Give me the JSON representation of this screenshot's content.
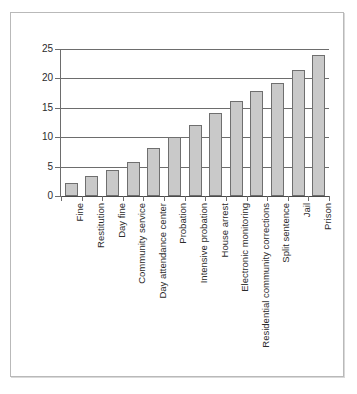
{
  "chart_data": {
    "type": "bar",
    "title": "",
    "subtitle": "",
    "xlabel": "",
    "ylabel": "",
    "ylim": [
      0,
      25
    ],
    "yticks": [
      0,
      5,
      10,
      15,
      20,
      25
    ],
    "ytick_labels": [
      "0",
      "5",
      "10",
      "15",
      "20",
      "25"
    ],
    "grid": true,
    "grid_axis": "y",
    "legend": null,
    "orientation": "vertical",
    "categories": [
      "Fine",
      "Restitution",
      "Day fine",
      "Community service",
      "Day attendance center",
      "Probation",
      "Intensive probation",
      "House arrest",
      "Electronic monitoring",
      "Residential community corrections",
      "Split sentence",
      "Jail",
      "Prison"
    ],
    "values": [
      2.2,
      3.4,
      4.5,
      5.8,
      8.1,
      10.0,
      12.0,
      14.2,
      16.1,
      17.8,
      19.2,
      21.4,
      24.0
    ],
    "series": [
      {
        "name": "",
        "values": [
          2.2,
          3.4,
          4.5,
          5.8,
          8.1,
          10.0,
          12.0,
          14.2,
          16.1,
          17.8,
          19.2,
          21.4,
          24.0
        ]
      }
    ],
    "colors": {
      "bar_fill": "#c9c9c9",
      "bar_edge": "#6f6f6f",
      "gridline": "#6d6d6d",
      "axis": "#6d6d6d",
      "text": "#2b2b2b",
      "frame": "#b9b9b9",
      "background": "#ffffff"
    }
  }
}
